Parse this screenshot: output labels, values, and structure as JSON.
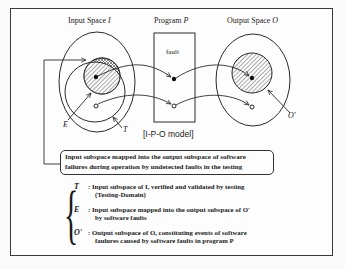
{
  "diagram": {
    "caption": "[I-P-O model]",
    "headers": {
      "input": {
        "label": "Input Space",
        "symbol": "I"
      },
      "program": {
        "label": "Program",
        "symbol": "P"
      },
      "output": {
        "label": "Output Space",
        "symbol": "O"
      }
    },
    "program_box_label": "fault",
    "point_labels": {
      "E": "E",
      "T": "T",
      "O_prime": "O'"
    },
    "callout": {
      "line1": "Input subspace mapped into the output subspace of software",
      "line2": "failures during operation by undetected faults in the testing"
    },
    "legend": [
      {
        "symbol": "T",
        "line1": ": Input subspace of I, verified and validated by testing",
        "line2": "(Testing-Domain)"
      },
      {
        "symbol": "E",
        "line1": ": Input subspace mapped into the output subspace of O'",
        "line2": "by software faults"
      },
      {
        "symbol": "O'",
        "line1": ": Output subspace of O, constituting events of software",
        "line2": "faulures caused by software faults in program P"
      }
    ]
  },
  "colors": {
    "line": "#2a2a2a",
    "hatch": "#555555",
    "background": "#fdfdfd"
  }
}
